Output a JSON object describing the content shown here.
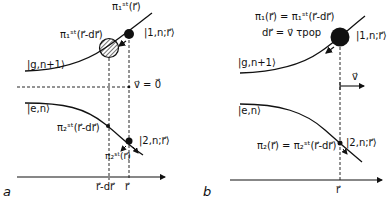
{
  "panels": [
    {
      "id": "a",
      "letter": "a",
      "labels": {
        "upper_state": "|g,n+1⟩",
        "lower_state": "|e,n⟩",
        "dressed_1": "|1,n;r⃗⟩",
        "dressed_2": "|2,n;r⃗⟩",
        "pi1_r": "π₁ˢᵗ(r⃗)",
        "pi1_r_dr": "π₁ˢᵗ(r⃗-dr⃗)",
        "pi2_r_dr": "π₂ˢᵗ(r⃗-dr⃗)",
        "pi2_r": "π₂ˢᵗ(r⃗)",
        "velocity": "v⃗ = 0⃗",
        "axis_tick_1": "r⃗-dr⃗",
        "axis_tick_2": "r⃗"
      }
    },
    {
      "id": "b",
      "letter": "b",
      "labels": {
        "upper_state": "|g,n+1⟩",
        "lower_state": "|e,n⟩",
        "dressed_1": "|1,n;r⃗⟩",
        "dressed_2": "|2,n;r⃗⟩",
        "pi1_eq": "π₁(r⃗) = π₁ˢᵗ(r⃗-dr⃗)",
        "dr_eq": "dr⃗ = v⃗ τpop",
        "pi2_eq": "π₂(r⃗) = π₂ˢᵗ(r⃗-dr⃗)",
        "velocity": "v⃗",
        "axis_tick": "r⃗"
      }
    }
  ]
}
